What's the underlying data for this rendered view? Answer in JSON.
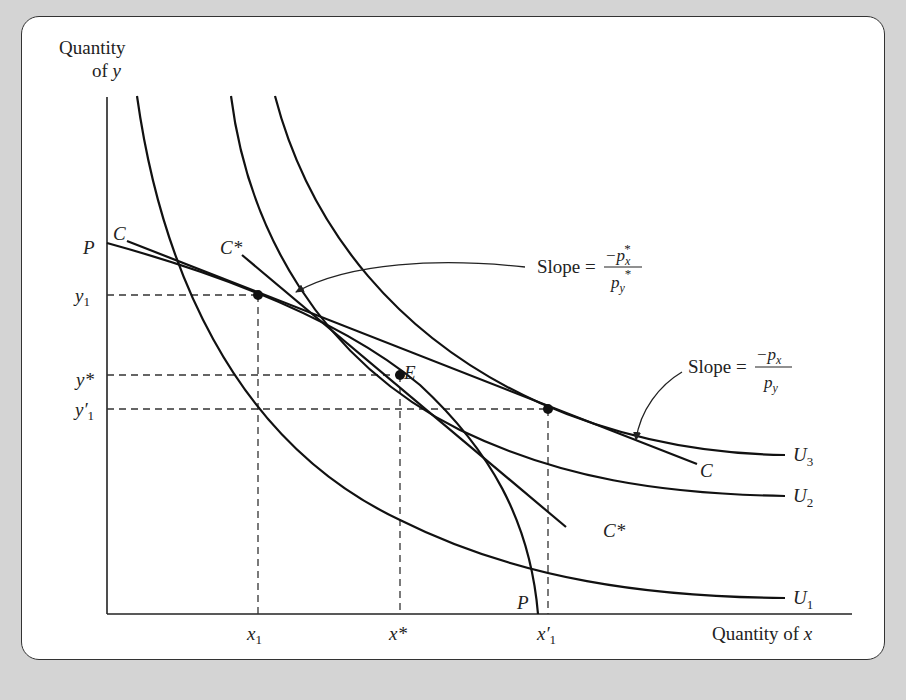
{
  "figure": {
    "y_axis_label_line1": "Quantity",
    "y_axis_label_line2_prefix": "of ",
    "y_axis_label_line2_var": "y",
    "x_axis_label_prefix": "Quantity of ",
    "x_axis_label_var": "x",
    "curves": {
      "ppf": "P",
      "ppf_bottom": "P",
      "price_line_initial": "C",
      "price_line_initial_end": "C",
      "price_line_new": "C*",
      "price_line_new_end": "C*",
      "indifference": [
        "U1",
        "U2",
        "U3"
      ]
    },
    "points": {
      "equilibrium": "E"
    },
    "y_ticks": {
      "y1": "y",
      "y1_sub": "1",
      "ystar": "y*",
      "y1prime": "y′",
      "y1prime_sub": "1"
    },
    "x_ticks": {
      "x1": "x",
      "x1_sub": "1",
      "xstar": "x*",
      "x1prime": "x′",
      "x1prime_sub": "1"
    },
    "annotations": {
      "slope_star_label": "Slope =",
      "slope_star_num": "−p",
      "slope_star_num_sub": "x",
      "slope_star_den": "p",
      "slope_star_den_sub": "y",
      "star": "*",
      "slope_label": "Slope =",
      "slope_num": "−p",
      "slope_num_sub": "x",
      "slope_den": "p",
      "slope_den_sub": "y"
    },
    "colors": {
      "background": "#d4d4d4",
      "panel": "#ffffff",
      "ink": "#222222"
    }
  }
}
